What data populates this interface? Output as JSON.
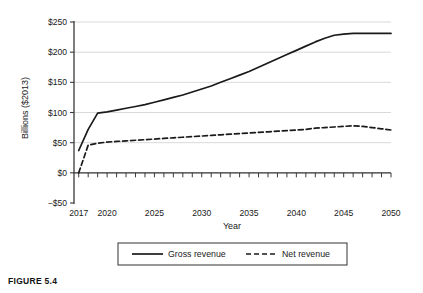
{
  "figure": {
    "caption": "FIGURE 5.4"
  },
  "chart_data": {
    "type": "line",
    "title": "",
    "xlabel": "Year",
    "ylabel": "Billions ($2013)",
    "xlim": [
      2016.5,
      2050
    ],
    "ylim": [
      -50,
      250
    ],
    "yticks": [
      -50,
      0,
      50,
      100,
      150,
      200,
      250
    ],
    "ytick_labels": [
      "−$50",
      "$0",
      "$50",
      "$100",
      "$150",
      "$200",
      "$250"
    ],
    "xticks": [
      2017,
      2020,
      2025,
      2030,
      2035,
      2040,
      2045,
      2050
    ],
    "xtick_labels": [
      "2017",
      "2020",
      "2025",
      "2030",
      "2035",
      "2040",
      "2045",
      "2050"
    ],
    "minor_xtick_step": 1,
    "grid": "horizontal",
    "grid_color": "#cfcfcf",
    "axis_color": "#3a3a3a",
    "legend_position": "below-center",
    "legend_border": true,
    "x": [
      2017,
      2018,
      2019,
      2020,
      2021,
      2022,
      2023,
      2024,
      2025,
      2026,
      2027,
      2028,
      2029,
      2030,
      2031,
      2032,
      2033,
      2034,
      2035,
      2036,
      2037,
      2038,
      2039,
      2040,
      2041,
      2042,
      2043,
      2044,
      2045,
      2046,
      2047,
      2048,
      2049,
      2050
    ],
    "series": [
      {
        "name": "Gross revenue",
        "style": "solid",
        "color": "#1a1a1a",
        "values": [
          37,
          72,
          99,
          101,
          104,
          107,
          110,
          113,
          117,
          121,
          125,
          129,
          134,
          139,
          144,
          150,
          156,
          162,
          168,
          175,
          182,
          189,
          196,
          203,
          210,
          217,
          223,
          228,
          230,
          231,
          231,
          231,
          231,
          231
        ]
      },
      {
        "name": "Net revenue",
        "style": "dashed",
        "color": "#1a1a1a",
        "values": [
          0,
          46,
          49,
          51,
          52,
          53,
          54,
          55,
          56,
          57,
          58,
          59,
          60,
          61,
          62,
          63,
          64,
          65,
          66,
          67,
          68,
          69,
          70,
          71,
          72,
          74,
          75,
          76,
          77,
          78,
          77,
          75,
          73,
          71
        ]
      }
    ]
  }
}
